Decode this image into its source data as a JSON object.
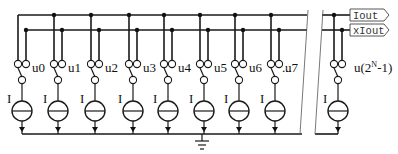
{
  "diagram": {
    "type": "current-steering DAC schematic",
    "ports": [
      {
        "id": "iout",
        "label": "Iout"
      },
      {
        "id": "xiout",
        "label": "xIout"
      }
    ],
    "cells": [
      {
        "switch": "u0",
        "source": "I"
      },
      {
        "switch": "u1",
        "source": "I"
      },
      {
        "switch": "u2",
        "source": "I"
      },
      {
        "switch": "u3",
        "source": "I"
      },
      {
        "switch": "u4",
        "source": "I"
      },
      {
        "switch": "u5",
        "source": "I"
      },
      {
        "switch": "u6",
        "source": "I"
      },
      {
        "switch": "u7",
        "source": "I"
      }
    ],
    "ellipsis": "...",
    "last_cell": {
      "switch_prefix": "u(2",
      "switch_sup": "N",
      "switch_suffix": "-1)",
      "source": "I"
    },
    "ground": "ground"
  }
}
